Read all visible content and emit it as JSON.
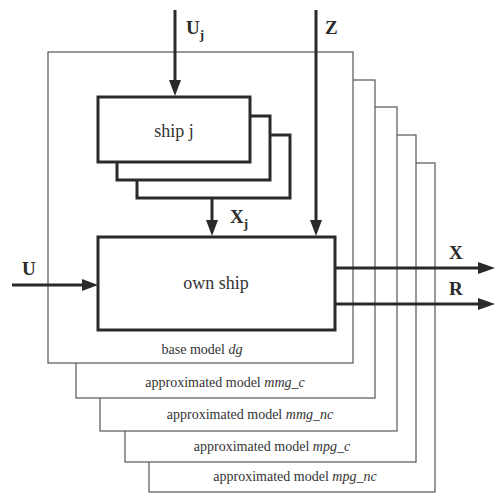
{
  "diagram": {
    "layers": [
      {
        "prefix": "base model ",
        "model": "dg"
      },
      {
        "prefix": "approximated model ",
        "model": "mmg_c"
      },
      {
        "prefix": "approximated model ",
        "model": "mmg_nc"
      },
      {
        "prefix": "approximated model ",
        "model": "mpg_c"
      },
      {
        "prefix": "approximated model ",
        "model": "mpg_nc"
      }
    ],
    "blocks": {
      "ship_j": "ship j",
      "own_ship": "own ship"
    },
    "signals": {
      "uj_main": "U",
      "uj_sub": "j",
      "z": "Z",
      "xj_main": "X",
      "xj_sub": "j",
      "u": "U",
      "x": "X",
      "r": "R"
    },
    "colors": {
      "stroke": "#2a2a2a",
      "frame": "#555555",
      "text": "#333333"
    }
  }
}
